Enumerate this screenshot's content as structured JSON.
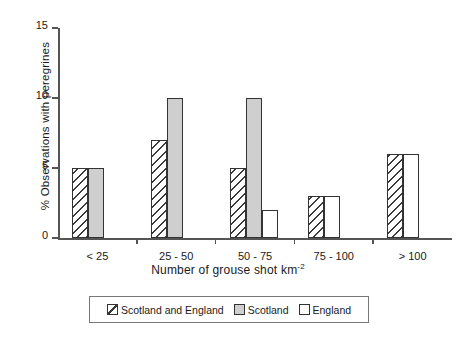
{
  "chart_data": {
    "type": "bar",
    "title": "",
    "xlabel": "Number of grouse shot km-2",
    "xlabel_base": "Number of grouse shot km",
    "xlabel_exponent": "-2",
    "ylabel": "% Observations with peregrines",
    "ylim": [
      0,
      15
    ],
    "yticks": [
      0,
      5,
      10,
      15
    ],
    "ytick_labels": [
      "0",
      "5",
      "10",
      "15"
    ],
    "grid": false,
    "legend_position": "below-axes",
    "categories": [
      "< 25",
      "25 - 50",
      "50 - 75",
      "75 - 100",
      "> 100"
    ],
    "series": [
      {
        "name": "Scotland and England",
        "pattern": "diagonal-hatch",
        "color": "#ffffff",
        "values": [
          5,
          7,
          5,
          3,
          6
        ]
      },
      {
        "name": "Scotland",
        "pattern": "solid-gray",
        "color": "#cfcfcf",
        "values": [
          5,
          10,
          10,
          null,
          null
        ]
      },
      {
        "name": "England",
        "pattern": "dotted",
        "color": "#ffffff",
        "values": [
          null,
          null,
          2,
          3,
          6
        ]
      }
    ]
  },
  "legend": {
    "items": [
      {
        "label": "Scotland and England",
        "swatch": "hatch"
      },
      {
        "label": "Scotland",
        "swatch": "solid"
      },
      {
        "label": "England",
        "swatch": "dots"
      }
    ]
  },
  "colors": {
    "axis": "#555555",
    "bar_outline": "#333333",
    "scotland_fill": "#cfcfcf"
  }
}
